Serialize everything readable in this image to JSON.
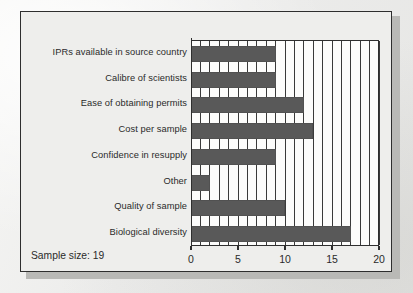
{
  "figure": {
    "footer_note": "Sample size: 19",
    "background_color": "#eeeeec",
    "bar_color": "#595959",
    "frame_color": "#2e2e2e"
  },
  "chart_data": {
    "type": "bar",
    "orientation": "horizontal",
    "title": "",
    "xlabel": "",
    "ylabel": "",
    "categories": [
      "IPRs available in source country",
      "Calibre of scientists",
      "Ease of obtaining permits",
      "Cost per sample",
      "Confidence in resupply",
      "Other",
      "Quality of sample",
      "Biological diversity"
    ],
    "values": [
      9,
      9,
      12,
      13,
      9,
      2,
      10,
      17
    ],
    "xlim": [
      0,
      20
    ],
    "xticks": [
      0,
      5,
      10,
      15,
      20
    ],
    "xtick_labels": [
      "0",
      "5",
      "10",
      "15",
      "20"
    ],
    "minor_gridline_step": 1,
    "grid": true,
    "legend": null,
    "annotations": [
      "Sample size: 19"
    ]
  }
}
